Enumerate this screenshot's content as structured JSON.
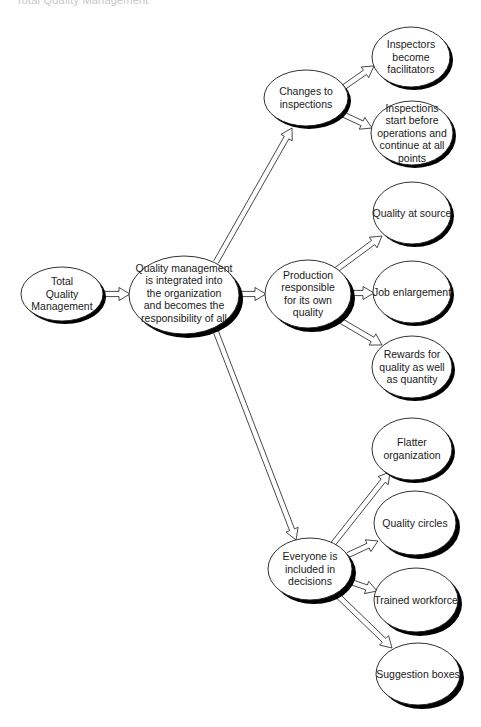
{
  "header": {
    "running_title": "Total Quality Management"
  },
  "colors": {
    "stroke": "#1a1a1a",
    "shadow": "#000000",
    "fill": "#ffffff",
    "text": "#1a1a1a"
  },
  "nodes": {
    "root": {
      "lines": [
        "Total",
        "Quality",
        "Management"
      ]
    },
    "central": {
      "lines": [
        "Quality management",
        "is integrated into",
        "the organization",
        "and becomes the",
        "responsibility of all"
      ]
    },
    "changes": {
      "lines": [
        "Changes to",
        "inspections"
      ]
    },
    "production": {
      "lines": [
        "Production",
        "responsible",
        "for its own",
        "quality"
      ]
    },
    "everyone": {
      "lines": [
        "Everyone is",
        "included in",
        "decisions"
      ]
    },
    "inspectors": {
      "lines": [
        "Inspectors",
        "become",
        "facilitators"
      ]
    },
    "inspections_start": {
      "lines": [
        "Inspections",
        "start before",
        "operations and",
        "continue at all",
        "points"
      ]
    },
    "quality_source": {
      "lines": [
        "Quality at source"
      ]
    },
    "job": {
      "lines": [
        "Job enlargement"
      ]
    },
    "rewards": {
      "lines": [
        "Rewards for",
        "quality as well",
        "as quantity"
      ]
    },
    "flatter": {
      "lines": [
        "Flatter",
        "organization"
      ]
    },
    "circles": {
      "lines": [
        "Quality circles"
      ]
    },
    "trained": {
      "lines": [
        "Trained workforce"
      ]
    },
    "suggestion": {
      "lines": [
        "Suggestion boxes"
      ]
    }
  }
}
